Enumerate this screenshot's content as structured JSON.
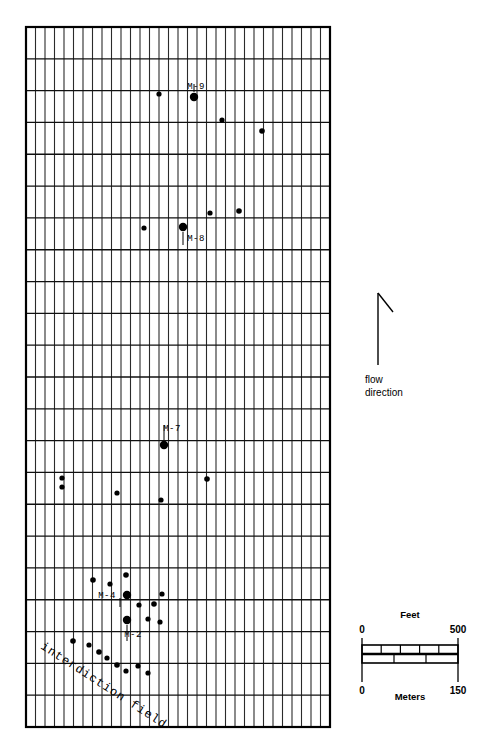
{
  "figure": {
    "background_color": "#ffffff",
    "line_color": "#1a1a1a"
  },
  "grid": {
    "name": "site-grid",
    "x": 26,
    "y": 27,
    "width": 304,
    "height": 700,
    "minor_columns": 32,
    "major_rows": 22,
    "minor_line_color": "#2b2b2b",
    "major_line_color": "#101010",
    "border_color": "#000000"
  },
  "wells": [
    {
      "id": "M-9",
      "label": "M-9",
      "x": 194,
      "y": 97,
      "r": 4.2,
      "label_x": 196,
      "label_y": 89,
      "label_anchor": "middle",
      "leader": {
        "x1": 194,
        "y1": 92,
        "x2": 194,
        "y2": 84
      }
    },
    {
      "id": "M-8",
      "label": "M-8",
      "x": 183,
      "y": 227,
      "r": 4.2,
      "label_x": 196,
      "label_y": 241,
      "label_anchor": "middle",
      "leader": {
        "x1": 183,
        "y1": 232,
        "x2": 183,
        "y2": 245
      }
    },
    {
      "id": "M-7",
      "label": "M-7",
      "x": 164,
      "y": 445,
      "r": 4.2,
      "label_x": 172,
      "label_y": 431,
      "label_anchor": "middle",
      "leader": {
        "x1": 164,
        "y1": 440,
        "x2": 164,
        "y2": 425
      }
    },
    {
      "id": "M-4",
      "label": "M-4",
      "x": 127,
      "y": 595,
      "r": 4.2,
      "label_x": 107,
      "label_y": 598,
      "label_anchor": "middle",
      "leader": {
        "x1": 120,
        "y1": 598,
        "x2": 120,
        "y2": 607
      }
    },
    {
      "id": "M-2",
      "label": "M-2",
      "x": 127,
      "y": 620,
      "r": 4.2,
      "label_x": 133,
      "label_y": 637,
      "label_anchor": "middle",
      "leader": {
        "x1": 127,
        "y1": 625,
        "x2": 127,
        "y2": 641
      }
    }
  ],
  "points": [
    {
      "x": 159,
      "y": 94,
      "r": 2.6
    },
    {
      "x": 222,
      "y": 120,
      "r": 2.6
    },
    {
      "x": 262,
      "y": 131,
      "r": 2.8
    },
    {
      "x": 144,
      "y": 228,
      "r": 2.6
    },
    {
      "x": 210,
      "y": 213,
      "r": 2.6
    },
    {
      "x": 239,
      "y": 211,
      "r": 2.8
    },
    {
      "x": 62,
      "y": 478,
      "r": 2.6
    },
    {
      "x": 62,
      "y": 487,
      "r": 2.6
    },
    {
      "x": 117,
      "y": 493,
      "r": 2.6
    },
    {
      "x": 161,
      "y": 500,
      "r": 2.6
    },
    {
      "x": 207,
      "y": 479,
      "r": 2.8
    },
    {
      "x": 93,
      "y": 580,
      "r": 2.8
    },
    {
      "x": 110,
      "y": 584,
      "r": 2.6
    },
    {
      "x": 126,
      "y": 575,
      "r": 2.8
    },
    {
      "x": 139,
      "y": 605,
      "r": 2.6
    },
    {
      "x": 154,
      "y": 604,
      "r": 2.8
    },
    {
      "x": 148,
      "y": 619,
      "r": 2.6
    },
    {
      "x": 160,
      "y": 622,
      "r": 2.6
    },
    {
      "x": 162,
      "y": 594,
      "r": 2.6
    },
    {
      "x": 73,
      "y": 641,
      "r": 2.8
    },
    {
      "x": 89,
      "y": 645,
      "r": 2.6
    },
    {
      "x": 99,
      "y": 652,
      "r": 2.8
    },
    {
      "x": 107,
      "y": 658,
      "r": 2.6
    },
    {
      "x": 117,
      "y": 665,
      "r": 2.8
    },
    {
      "x": 126,
      "y": 671,
      "r": 2.6
    },
    {
      "x": 138,
      "y": 666,
      "r": 2.6
    },
    {
      "x": 148,
      "y": 673,
      "r": 2.6
    }
  ],
  "interdiction": {
    "name": "interdiction-field-label",
    "text": "interdiction field",
    "x": 40,
    "y": 648,
    "rotation": 33
  },
  "flow": {
    "name": "flow-direction-indicator",
    "line": {
      "x1": 378,
      "y1": 365,
      "x2": 378,
      "y2": 293
    },
    "barb": {
      "x1": 378,
      "y1": 293,
      "x2": 393,
      "y2": 312
    },
    "caption_line1": "flow",
    "caption_line2": "direction",
    "caption_x": 365,
    "caption_y1": 383,
    "caption_y2": 396
  },
  "scalebar": {
    "name": "scale-bar",
    "top_caption": "Feet",
    "bottom_caption": "Meters",
    "feet_min": "0",
    "feet_max": "500",
    "meters_min": "0",
    "meters_max": "150",
    "x": 362,
    "y": 645,
    "width": 96,
    "bar_height": 18,
    "feet_divisions": 5,
    "meters_divisions": 3,
    "tick_top_y": 638,
    "tick_bottom_y": 682,
    "top_caption_y": 618,
    "bottom_caption_y": 700,
    "feet_label_y": 633,
    "meters_label_y": 694
  }
}
